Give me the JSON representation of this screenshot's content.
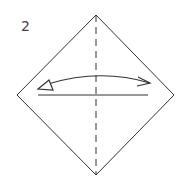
{
  "diagram": {
    "step_number": "2",
    "type": "origami-fold-instruction",
    "shape": "square-rotated-45 (diamond)",
    "elements": [
      {
        "name": "paper-outline",
        "kind": "diamond"
      },
      {
        "name": "valley-fold-line",
        "kind": "dashed-vertical"
      },
      {
        "name": "crease-line",
        "kind": "solid-horizontal"
      },
      {
        "name": "fold-and-unfold-arrow",
        "kind": "curved-double-arrow"
      }
    ],
    "colors": {
      "line": "#333333",
      "background": "#ffffff"
    }
  }
}
